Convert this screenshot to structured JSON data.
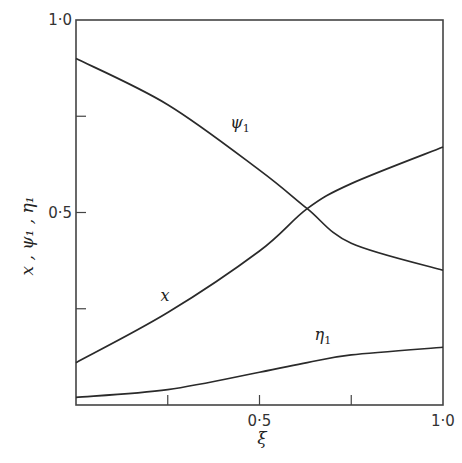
{
  "chart_data": {
    "type": "line",
    "title": "",
    "xlabel": "ξ",
    "ylabel": "x , ψ₁ , η₁",
    "xlim": [
      0,
      1.0
    ],
    "ylim": [
      0,
      1.0
    ],
    "x_tick_labels": [
      {
        "value": 0.5,
        "label": "0·5"
      },
      {
        "value": 1.0,
        "label": "1·0"
      }
    ],
    "x_minor_ticks": [
      0.25,
      0.75
    ],
    "y_tick_labels": [
      {
        "value": 0.5,
        "label": "0·5"
      },
      {
        "value": 1.0,
        "label": "1·0"
      }
    ],
    "y_minor_ticks": [
      0.25,
      0.75
    ],
    "grid": false,
    "legend": "none (curves labeled inline)",
    "x": [
      0,
      0.25,
      0.5,
      0.63,
      0.75,
      1.0
    ],
    "series": [
      {
        "name": "ψ₁",
        "label": "ψ",
        "subscript": "1",
        "values": [
          0.9,
          0.78,
          0.61,
          0.51,
          0.42,
          0.35
        ]
      },
      {
        "name": "x",
        "label": "x",
        "subscript": "",
        "values": [
          0.11,
          0.24,
          0.4,
          0.51,
          0.575,
          0.67
        ]
      },
      {
        "name": "η₁",
        "label": "η",
        "subscript": "1",
        "values": [
          0.02,
          0.04,
          0.085,
          0.11,
          0.13,
          0.15
        ]
      }
    ],
    "annotations": [
      {
        "text": "ψ₁",
        "near": [
          0.42,
          0.72
        ]
      },
      {
        "text": "x",
        "near": [
          0.23,
          0.27
        ]
      },
      {
        "text": "η₁",
        "near": [
          0.65,
          0.17
        ]
      }
    ]
  }
}
